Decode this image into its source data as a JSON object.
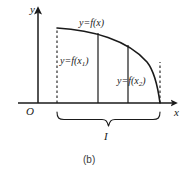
{
  "figure": {
    "caption": "(b)",
    "axes": {
      "y_label": "y",
      "x_label": "x",
      "origin_label": "O"
    },
    "labels": {
      "curve": "y=f(x)",
      "left_ordinate_prefix": "y=f(x",
      "left_ordinate_sub": "1",
      "left_ordinate_suffix": ")",
      "right_ordinate_prefix": "y=f(x",
      "right_ordinate_sub": "2",
      "right_ordinate_suffix": ")",
      "interval": "I"
    },
    "colors": {
      "stroke": "#1a1a1a",
      "background": "#ffffff",
      "caption": "#3a3a3a"
    },
    "geometry": {
      "y_axis_x": 38,
      "x_axis_y": 103,
      "curve_start": [
        57,
        28
      ],
      "curve_end": [
        160,
        103
      ],
      "vertical_line_1_x": 98,
      "vertical_line_2_x": 128,
      "dashed_left_x": 57,
      "dashed_right_x": 160,
      "brace_left_x": 57,
      "brace_right_x": 160,
      "brace_y": 112
    }
  }
}
